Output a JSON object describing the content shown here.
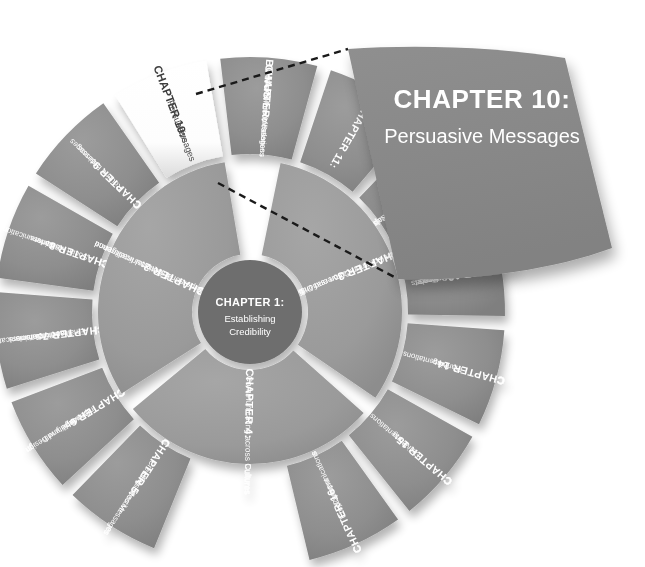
{
  "figure": {
    "type": "radial-chapter-wheel",
    "accent_gray_outer": "#8d8d8d",
    "accent_gray_inner": "#9a9a9a",
    "hub_gray": "#6e6e6e",
    "callout_gray": "#8a8a8a",
    "highlight_fill": "#ffffff",
    "leader_line_color": "#1a1a1a"
  },
  "hub": {
    "title": "CHAPTER 1:",
    "subtitle_lines": [
      "Establishing",
      "Credibility"
    ]
  },
  "inner_ring": [
    {
      "id": "chapter-2",
      "title": "CHAPTER 2:",
      "subtitle_lines": [
        "Interpersonal Communication and",
        "Emotional Intelligence"
      ]
    },
    {
      "id": "chapter-3",
      "title": "CHAPTER 3:",
      "subtitle_lines": [
        "Team Communication and Difficult",
        "Conversations"
      ]
    },
    {
      "id": "chapter-4",
      "title": "CHAPTER 4:",
      "subtitle_lines": [
        "Communicating across Cultures"
      ]
    }
  ],
  "outer_ring": [
    {
      "id": "chapter-5",
      "title": "CHAPTER 5:",
      "subtitle_lines": [
        "Creating Effective",
        "Business Messages"
      ]
    },
    {
      "id": "chapter-6",
      "title": "CHAPTER 6:",
      "subtitle_lines": [
        "Improving",
        "Readability with",
        "Style and Design"
      ]
    },
    {
      "id": "chapter-7",
      "title": "CHAPTER 7:",
      "subtitle_lines": [
        "Email and Other",
        "Traditional Tools",
        "for Business",
        "Communication"
      ]
    },
    {
      "id": "chapter-8",
      "title": "CHAPTER 8:",
      "subtitle_lines": [
        "Social Media for",
        "Business",
        "Communication"
      ]
    },
    {
      "id": "chapter-9",
      "title": "CHAPTER 9:",
      "subtitle_lines": [
        "Routine Business",
        "Messages"
      ]
    },
    {
      "id": "chapter-10",
      "title": "CHAPTER 10:",
      "subtitle_lines": [
        "Persuasive",
        "Messages"
      ],
      "highlighted": true
    },
    {
      "id": "bonus-chapter",
      "title_lines": [
        "BONUS",
        "CHAPTER:"
      ],
      "subtitle_lines": [
        "Crisis Communication",
        "and Public Relations",
        "Messages"
      ]
    },
    {
      "id": "chapter-11",
      "title": "CHAPTER 11:",
      "subtitle_lines": [],
      "occluded": true
    },
    {
      "id": "chapter-12",
      "title": "CHAPTER 12:",
      "subtitle_lines": [
        "Research and",
        "Planning",
        "for Business Proposals",
        "and Business Reports"
      ]
    },
    {
      "id": "chapter-13",
      "title": "CHAPTER 13:",
      "subtitle_lines": [
        "Completing",
        "Business Proposals",
        "and Business",
        "Reports"
      ]
    },
    {
      "id": "chapter-14",
      "title": "CHAPTER 14:",
      "subtitle_lines": [
        "Planning",
        "Presentations"
      ]
    },
    {
      "id": "chapter-15",
      "title": "CHAPTER 15:",
      "subtitle_lines": [
        "Delivering",
        "Presentations"
      ]
    },
    {
      "id": "chapter-16",
      "title": "CHAPTER 16:",
      "subtitle_lines": [
        "Employment",
        "Communications"
      ]
    }
  ],
  "callout": {
    "title": "CHAPTER 10:",
    "subtitle": "Persuasive Messages"
  }
}
